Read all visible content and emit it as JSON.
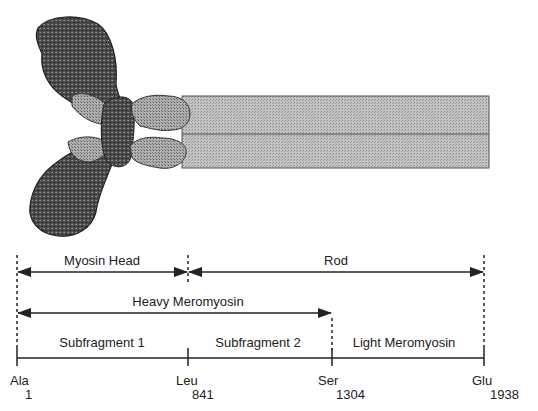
{
  "figure": {
    "molecule": "myosin",
    "rod_color": "#b8b8b8",
    "head_dark": "#3a3a3a",
    "head_light": "#a8a8a8"
  },
  "regions": {
    "myosin_head": "Myosin Head",
    "rod": "Rod",
    "heavy_meromyosin": "Heavy Meromyosin"
  },
  "segments": [
    {
      "label": "Subfragment 1"
    },
    {
      "label": "Subfragment 2"
    },
    {
      "label": "Light Meromyosin"
    }
  ],
  "residues": [
    {
      "aa": "Ala",
      "num": "1"
    },
    {
      "aa": "Leu",
      "num": "841"
    },
    {
      "aa": "Ser",
      "num": "1304"
    },
    {
      "aa": "Glu",
      "num": "1938"
    }
  ]
}
